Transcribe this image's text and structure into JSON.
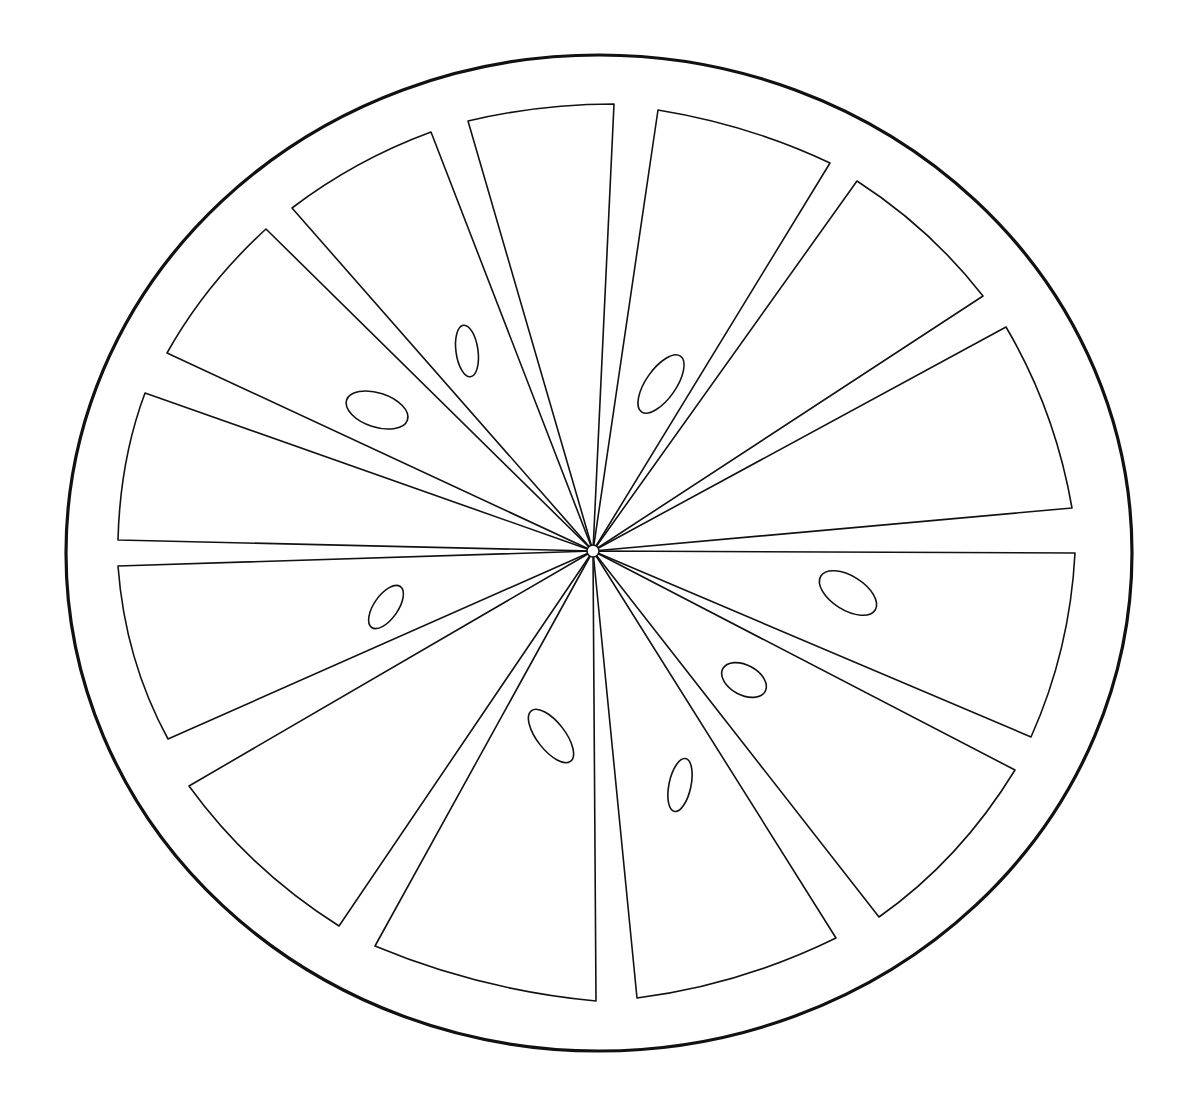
{
  "image": {
    "subject": "citrus slice coloring page",
    "background": "#ffffff",
    "line_color": "#111111"
  },
  "rind": {
    "cx": 599,
    "cy": 553,
    "rx": 533,
    "ry": 498
  },
  "hub": {
    "cx": 593,
    "cy": 551,
    "r": 6
  },
  "segments": [
    {
      "a": [
        468,
        121
      ],
      "b": [
        614,
        104
      ],
      "ctrl": [
        540,
        104
      ]
    },
    {
      "a": [
        658,
        110
      ],
      "b": [
        830,
        163
      ],
      "ctrl": [
        750,
        125
      ]
    },
    {
      "a": [
        857,
        181
      ],
      "b": [
        983,
        296
      ],
      "ctrl": [
        930,
        228
      ]
    },
    {
      "a": [
        1006,
        327
      ],
      "b": [
        1072,
        508
      ],
      "ctrl": [
        1055,
        410
      ]
    },
    {
      "a": [
        1075,
        553
      ],
      "b": [
        1031,
        737
      ],
      "ctrl": [
        1070,
        650
      ]
    },
    {
      "a": [
        1015,
        770
      ],
      "b": [
        879,
        917
      ],
      "ctrl": [
        960,
        860
      ]
    },
    {
      "a": [
        836,
        938
      ],
      "b": [
        637,
        998
      ],
      "ctrl": [
        740,
        985
      ]
    },
    {
      "a": [
        596,
        1001
      ],
      "b": [
        375,
        946
      ],
      "ctrl": [
        480,
        990
      ]
    },
    {
      "a": [
        339,
        926
      ],
      "b": [
        189,
        786
      ],
      "ctrl": [
        250,
        870
      ]
    },
    {
      "a": [
        168,
        739
      ],
      "b": [
        118,
        566
      ],
      "ctrl": [
        125,
        660
      ]
    },
    {
      "a": [
        118,
        540
      ],
      "b": [
        145,
        393
      ],
      "ctrl": [
        120,
        460
      ]
    },
    {
      "a": [
        167,
        353
      ],
      "b": [
        266,
        229
      ],
      "ctrl": [
        205,
        285
      ]
    },
    {
      "a": [
        292,
        208
      ],
      "b": [
        431,
        132
      ],
      "ctrl": [
        355,
        160
      ]
    },
    {
      "a": [
        407,
        125
      ],
      "b": [
        468,
        121
      ],
      "ctrl": [
        437,
        122
      ],
      "skip": true
    }
  ],
  "seeds": [
    {
      "cx": 467,
      "cy": 351,
      "rx": 11,
      "ry": 26,
      "rot": -8
    },
    {
      "cx": 377,
      "cy": 410,
      "rx": 32,
      "ry": 17,
      "rot": 18
    },
    {
      "cx": 661,
      "cy": 384,
      "rx": 15,
      "ry": 34,
      "rot": 35
    },
    {
      "cx": 386,
      "cy": 607,
      "rx": 12,
      "ry": 25,
      "rot": 35
    },
    {
      "cx": 848,
      "cy": 593,
      "rx": 32,
      "ry": 17,
      "rot": 32
    },
    {
      "cx": 744,
      "cy": 680,
      "rx": 24,
      "ry": 15,
      "rot": 28
    },
    {
      "cx": 551,
      "cy": 736,
      "rx": 14,
      "ry": 32,
      "rot": -38
    },
    {
      "cx": 680,
      "cy": 785,
      "rx": 11,
      "ry": 27,
      "rot": 12
    }
  ]
}
